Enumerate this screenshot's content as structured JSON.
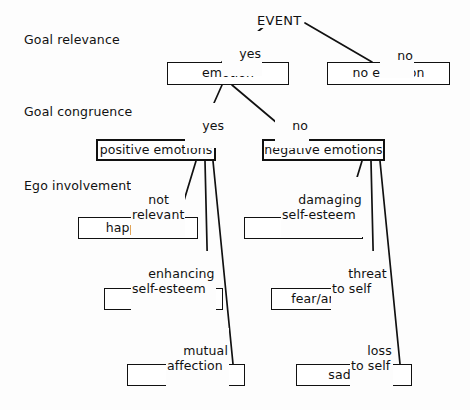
{
  "diagram": {
    "title": "EVENT",
    "root": {
      "label": "EVENT"
    },
    "stage_labels": [
      {
        "id": "goal-relevance",
        "label": "Goal relevance"
      },
      {
        "id": "goal-congruence",
        "label": "Goal congruence"
      },
      {
        "id": "ego-involvement",
        "label": "Ego involvement"
      }
    ],
    "nodes": [
      {
        "id": "emotion",
        "label": "emotion"
      },
      {
        "id": "no-emotion",
        "label": "no emotion"
      },
      {
        "id": "positive-emotions",
        "label": "positive emotions"
      },
      {
        "id": "negative-emotions",
        "label": "negative emotions"
      },
      {
        "id": "happiness",
        "label": "happiness"
      },
      {
        "id": "anger",
        "label": "anger"
      },
      {
        "id": "pride",
        "label": "pride"
      },
      {
        "id": "fear-anxiety",
        "label": "fear/anxiety"
      },
      {
        "id": "love",
        "label": "love"
      },
      {
        "id": "sadness",
        "label": "sadness"
      }
    ],
    "edge_labels": [
      {
        "id": "relevance-yes",
        "text": "yes"
      },
      {
        "id": "relevance-no",
        "text": "no"
      },
      {
        "id": "congruence-yes",
        "text": "yes"
      },
      {
        "id": "congruence-no",
        "text": "no"
      },
      {
        "id": "not-relevant",
        "text": "not\nrelevant"
      },
      {
        "id": "enhancing-esteem",
        "text": "enhancing\nself-esteem"
      },
      {
        "id": "mutual-affection",
        "text": "mutual\naffection"
      },
      {
        "id": "damaging-esteem",
        "text": "damaging\nself-esteem"
      },
      {
        "id": "threat-to-self",
        "text": "threat\nto self"
      },
      {
        "id": "loss-to-self",
        "text": "loss\nto self"
      }
    ],
    "colors": {
      "line": "#111111",
      "box_fill": "#ffffff",
      "text": "#111111",
      "background": "#fdfdfd"
    }
  }
}
